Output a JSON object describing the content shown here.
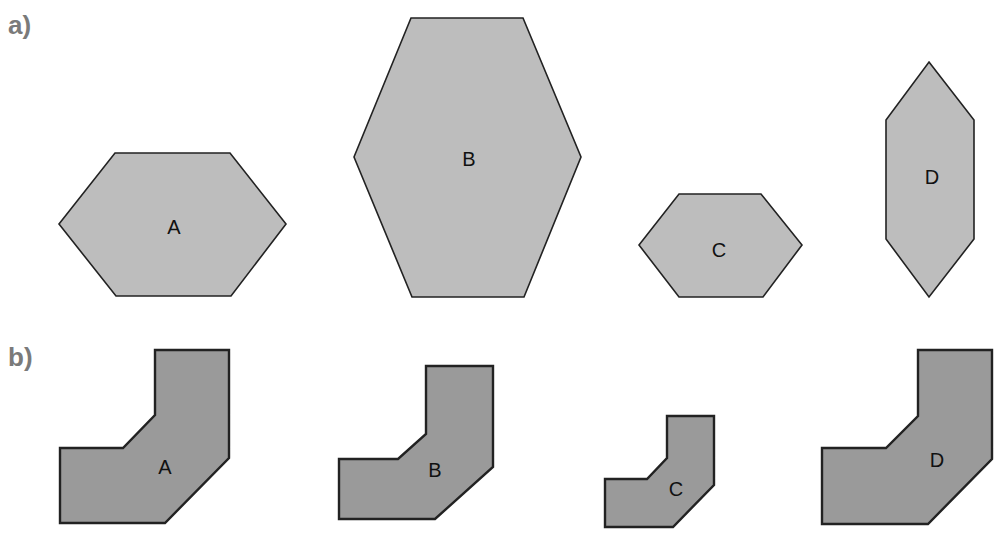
{
  "panels": [
    {
      "label": "a)",
      "shapes": [
        {
          "label": "A",
          "points": "115,153 230,153 286,224 231,296 116,296 59,224",
          "label_pos": [
            174,
            234
          ]
        },
        {
          "label": "B",
          "points": "411,18 523,18 581,157 524,297 412,297 354,157",
          "label_pos": [
            469,
            166
          ]
        },
        {
          "label": "C",
          "points": "679,194 761,194 802,245 763,297 679,297 639,245",
          "label_pos": [
            719,
            257
          ]
        },
        {
          "label": "D",
          "points": "929,62 974,120 974,239 929,297 886,239 886,120",
          "label_pos": [
            932,
            184
          ]
        }
      ]
    },
    {
      "label": "b)",
      "shapes": [
        {
          "label": "A",
          "points": "155,350 229,350 229,458 165,523 60,523 60,448 123,448 155,415",
          "label_pos": [
            165,
            474
          ]
        },
        {
          "label": "B",
          "points": "426,366 493,366 493,467 435,519 339,519 339,459 398,459 426,434",
          "label_pos": [
            435,
            477
          ]
        },
        {
          "label": "C",
          "points": "667,416 714,416 714,485 673,527 605,527 605,479 647,479 667,458",
          "label_pos": [
            676,
            496
          ]
        },
        {
          "label": "D",
          "points": "918,350 992,350 992,459 928,524 822,524 822,448 886,448 918,416",
          "label_pos": [
            937,
            467
          ]
        }
      ]
    }
  ],
  "colors": {
    "panel_a_fill": "#bdbdbd",
    "panel_b_fill": "#9a9a9a",
    "stroke": "#222222",
    "panel_label": "#7a7a7a"
  }
}
